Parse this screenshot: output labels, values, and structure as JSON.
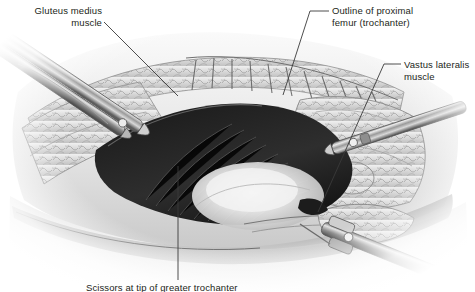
{
  "figure": {
    "kind": "surgical-anatomy-illustration",
    "palette": {
      "background": "#ffffff",
      "ink": "#231f20",
      "leader": "#3a3a3a",
      "tissue_light": "#e7e7e7",
      "tissue_mid": "#b5b5b5",
      "tissue_dark": "#6e6e6e",
      "wound_dark": "#141414",
      "bone_highlight": "#f2f2f2",
      "steel_light": "#dcdcdc",
      "steel_dark": "#5a5a5a"
    },
    "labels": [
      {
        "id": "gluteus-medius",
        "line1": "Gluteus medius",
        "line2": "muscle",
        "align": "right",
        "x": 6,
        "y": 6,
        "width": 96
      },
      {
        "id": "outline-proximal-femur",
        "line1": "Outline of proximal",
        "line2": "femur (trochanter)",
        "align": "left",
        "x": 332,
        "y": 6,
        "width": 120
      },
      {
        "id": "vastus-lateralis",
        "line1": "Vastus lateralis",
        "line2": "muscle",
        "align": "left",
        "x": 404,
        "y": 60,
        "width": 70
      },
      {
        "id": "scissors-at-tip",
        "line1": "Scissors at tip of greater trochanter",
        "line2": "",
        "align": "center",
        "x": 86,
        "y": 283,
        "width": 220
      }
    ],
    "leaders": [
      {
        "id": "leader-gluteus-medius",
        "from": [
          104,
          22
        ],
        "to": [
          178,
          96
        ]
      },
      {
        "id": "leader-outline-femur-dash",
        "from": [
          310,
          11
        ],
        "to": [
          329,
          11
        ]
      },
      {
        "id": "leader-outline-femur",
        "from": [
          310,
          11
        ],
        "to": [
          283,
          95
        ]
      },
      {
        "id": "leader-vastus-dash",
        "from": [
          384,
          64
        ],
        "to": [
          401,
          64
        ]
      },
      {
        "id": "leader-vastus",
        "from": [
          384,
          64
        ],
        "to": [
          318,
          212
        ]
      },
      {
        "id": "leader-scissors",
        "from": [
          178,
          166
        ],
        "to": [
          178,
          280
        ]
      }
    ]
  }
}
